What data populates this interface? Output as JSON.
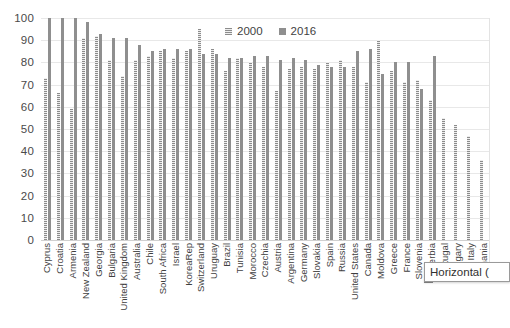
{
  "legend": {
    "position": "top-center",
    "items": [
      {
        "label": "2000",
        "swatch": "hatched-gray",
        "color": "#8c8c8c"
      },
      {
        "label": "2016",
        "swatch": "solid-gray",
        "color": "#8f8f8f"
      }
    ]
  },
  "axis": {
    "y_ticks": [
      "100",
      "90",
      "80",
      "70",
      "60",
      "50",
      "40",
      "30",
      "20",
      "10",
      "0"
    ]
  },
  "overlay": {
    "axis_title_box_text": "Horizontal ("
  },
  "chart_data": {
    "type": "bar",
    "title": "",
    "xlabel": "",
    "ylabel": "",
    "ylim": [
      0,
      100
    ],
    "ytick_step": 10,
    "grid": true,
    "legend_position": "top-center",
    "categories": [
      "Cyprus",
      "Croatia",
      "Armenia",
      "New Zealand",
      "Georgia",
      "Bulgaria",
      "United Kingdom",
      "Australia",
      "Chile",
      "South Africa",
      "Israel",
      "KoreaRep",
      "Switzerland",
      "Uruguay",
      "Brazil",
      "Tunisia",
      "Morocco",
      "Czechia",
      "Austria",
      "Argentina",
      "Germany",
      "Slovakia",
      "Spain",
      "Russia",
      "United States",
      "Canada",
      "Moldova",
      "Greece",
      "France",
      "Slovenia",
      "Serbia",
      "Portugal",
      "Hungary",
      "Italy",
      "Romania"
    ],
    "series": [
      {
        "name": "2000",
        "values": [
          73,
          66,
          59,
          91,
          92,
          81,
          74,
          81,
          83,
          85,
          82,
          85,
          95,
          86,
          76,
          82,
          80,
          78,
          67,
          77,
          78,
          77,
          80,
          81,
          78,
          71,
          90,
          76,
          71,
          72,
          63,
          55,
          52,
          47,
          36
        ]
      },
      {
        "name": "2016",
        "values": [
          100,
          100,
          100,
          98,
          93,
          91,
          91,
          88,
          85,
          86,
          86,
          86,
          84,
          84,
          82,
          82,
          83,
          83,
          81,
          82,
          81,
          79,
          78,
          78,
          85,
          86,
          75,
          80,
          80,
          68,
          83,
          0,
          0,
          0,
          0
        ]
      }
    ]
  }
}
